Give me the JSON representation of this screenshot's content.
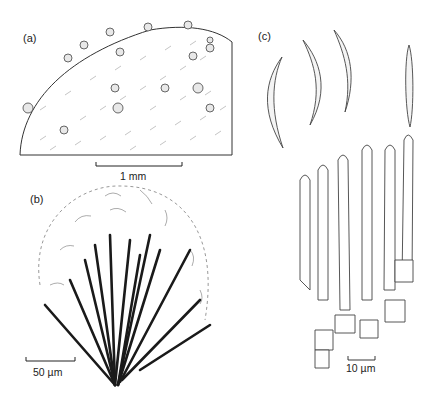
{
  "figure": {
    "panels": [
      {
        "id": "a",
        "label": "(a)",
        "scale_bar": "1 mm",
        "subject": "substrate fragment with scattered setose conidiomata"
      },
      {
        "id": "b",
        "label": "(b)",
        "scale_bar": "50 µm",
        "subject": "conidioma with dark setae and falcate conidia"
      },
      {
        "id": "c",
        "label": "(c)",
        "scale_bar": "10 µm",
        "subject": "falcate conidia and conidiogenous cells"
      }
    ],
    "colors": {
      "line": "#333333",
      "setae": "#1a1a1a",
      "dashed_outline": "#999999",
      "background": "#ffffff"
    }
  }
}
